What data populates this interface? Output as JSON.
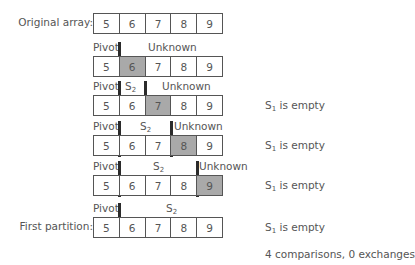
{
  "labels": {
    "original": "Original array:",
    "first_partition": "First partition:"
  },
  "segments": {
    "pivot": "Pivot",
    "unknown": "Unknown",
    "s2": "S",
    "s2_sub": "2",
    "s1": "S",
    "s1_sub": "1"
  },
  "colors": {
    "highlight": "#a9a9a9",
    "separator": "#2b2b2b",
    "border": "#555555"
  },
  "rows": [
    {
      "values": [
        "5",
        "6",
        "7",
        "8",
        "9"
      ],
      "highlight": -1,
      "note": ""
    },
    {
      "values": [
        "5",
        "6",
        "7",
        "8",
        "9"
      ],
      "highlight": 1,
      "note": ""
    },
    {
      "values": [
        "5",
        "6",
        "7",
        "8",
        "9"
      ],
      "highlight": 2,
      "note": " is empty"
    },
    {
      "values": [
        "5",
        "6",
        "7",
        "8",
        "9"
      ],
      "highlight": 3,
      "note": " is empty"
    },
    {
      "values": [
        "5",
        "6",
        "7",
        "8",
        "9"
      ],
      "highlight": 4,
      "note": " is empty"
    },
    {
      "values": [
        "5",
        "6",
        "7",
        "8",
        "9"
      ],
      "highlight": -1,
      "note": " is empty"
    }
  ],
  "summary": "4 comparisons, 0 exchanges"
}
